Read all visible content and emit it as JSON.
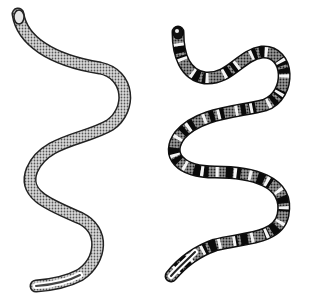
{
  "image": {
    "description": "Two engraved illustrations of snakes side by side on a white background",
    "background": "#ffffff",
    "subjects": [
      {
        "name": "plain-snake",
        "pattern": "uniform stippled scales",
        "colors": {
          "outline": "#222222",
          "body": "#bdbdbd",
          "highlight": "#f0f0f0"
        }
      },
      {
        "name": "banded-snake",
        "pattern": "alternating black and white rings over stippled body",
        "colors": {
          "outline": "#111111",
          "body": "#7a7a7a",
          "band_dark": "#0a0a0a",
          "band_light": "#f4f4f4"
        }
      }
    ]
  }
}
